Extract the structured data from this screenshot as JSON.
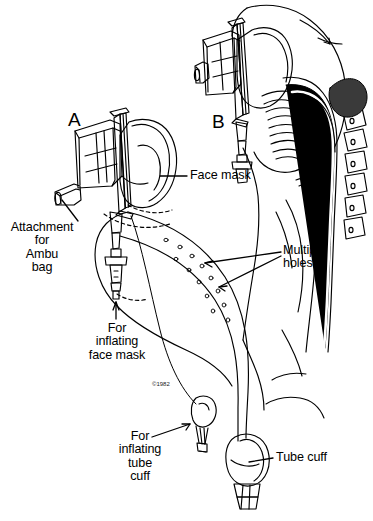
{
  "figure": {
    "kind": "medical-line-illustration",
    "background_color": "#ffffff",
    "ink_color": "#000000",
    "panels": [
      {
        "letter": "A",
        "description": "Esophageal obturator airway device with attached face mask shown alone"
      },
      {
        "letter": "B",
        "description": "Sagittal section of head and neck showing device positioned in situ"
      }
    ],
    "labels": {
      "panel_a": "A",
      "panel_b": "B",
      "face_mask": "Face mask",
      "attachment_ambu": "Attachment\nfor\nAmbu\nbag",
      "for_inflating_face_mask": "For\ninflating\nface mask",
      "multiple_holes": "Multiple\nholes",
      "for_inflating_tube_cuff": "For\ninflating\ntube\ncuff",
      "tube_cuff": "Tube cuff"
    },
    "copyright": "©1982"
  }
}
